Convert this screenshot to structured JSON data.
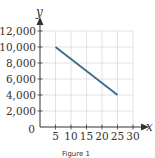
{
  "chart_data": {
    "type": "line",
    "title": "",
    "caption": "Figure 1",
    "xlabel": "x",
    "ylabel": "y",
    "xlim": [
      0,
      30
    ],
    "ylim": [
      0,
      12000
    ],
    "grid": true,
    "x_ticks": [
      5,
      10,
      15,
      20,
      25,
      30
    ],
    "x_tick_labels": [
      "5",
      "10",
      "15",
      "20",
      "25",
      "30"
    ],
    "y_ticks": [
      0,
      2000,
      4000,
      6000,
      8000,
      10000,
      12000
    ],
    "y_tick_labels": [
      "0",
      "2,000",
      "4,000",
      "6,000",
      "8,000",
      "10,000",
      "12,000"
    ],
    "series": [
      {
        "name": "line",
        "x": [
          5,
          25
        ],
        "y": [
          10000,
          4000
        ],
        "color": "#3d6a8a"
      }
    ],
    "colors": {
      "line": "#3d6a8a",
      "grid": "#dcdcdc",
      "axis": "#333333"
    }
  }
}
